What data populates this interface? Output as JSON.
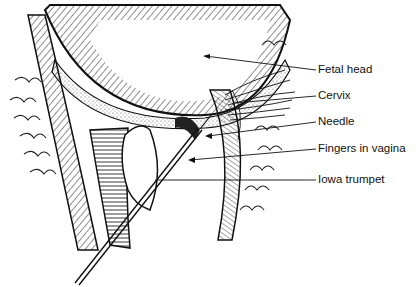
{
  "figure": {
    "labels": [
      {
        "id": "fetal-head",
        "text": "Fetal head",
        "x": 318,
        "y": 64
      },
      {
        "id": "cervix",
        "text": "Cervix",
        "x": 318,
        "y": 90
      },
      {
        "id": "needle",
        "text": "Needle",
        "x": 318,
        "y": 116
      },
      {
        "id": "fingers-in-vagina",
        "text": "Fingers in vagina",
        "x": 318,
        "y": 143
      },
      {
        "id": "iowa-trumpet",
        "text": "Iowa trumpet",
        "x": 318,
        "y": 174
      }
    ]
  }
}
